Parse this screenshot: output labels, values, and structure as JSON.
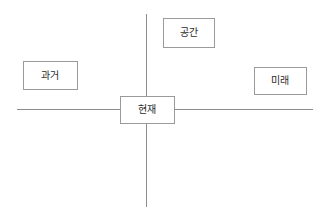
{
  "diagram": {
    "canvas": {
      "width": 329,
      "height": 222,
      "background_color": "#ffffff"
    },
    "style": {
      "line_color": "#8d8d8d",
      "box_border_color": "#9a9a9a",
      "box_fill_color": "#ffffff",
      "text_color": "#2b2b2b"
    },
    "axes": [
      {
        "name": "horizontal-axis",
        "orientation": "horizontal",
        "meaning": "시간",
        "x1": 17,
        "y1": 109,
        "x2": 313,
        "y2": 109
      },
      {
        "name": "vertical-axis",
        "orientation": "vertical",
        "meaning": "공간",
        "x1": 146,
        "y1": 14,
        "x2": 146,
        "y2": 207
      }
    ],
    "nodes": [
      {
        "id": "space",
        "label": "공간",
        "position": "top",
        "x": 163,
        "y": 18,
        "width": 52,
        "height": 30
      },
      {
        "id": "past",
        "label": "과거",
        "position": "left",
        "x": 23,
        "y": 61,
        "width": 55,
        "height": 29
      },
      {
        "id": "future",
        "label": "미래",
        "position": "right",
        "x": 254,
        "y": 67,
        "width": 53,
        "height": 28
      },
      {
        "id": "present",
        "label": "현재",
        "position": "center",
        "x": 120,
        "y": 96,
        "width": 55,
        "height": 28
      }
    ]
  }
}
